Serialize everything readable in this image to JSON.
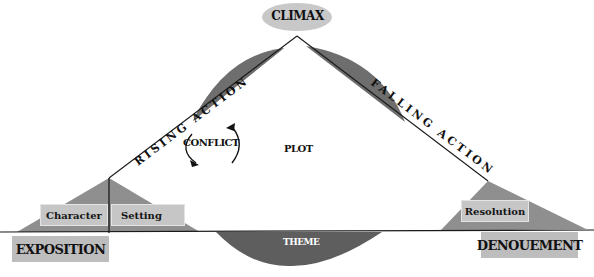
{
  "diagram": {
    "type": "plot-structure-diagram",
    "colors": {
      "background": "#ffffff",
      "climax_ellipse": "#c8c8c8",
      "dark_shade": "#6b6b6b",
      "light_shade": "#8e8e8e",
      "label_box": "#c6c6c6",
      "stage_box": "#bdbdbd",
      "line": "#1a1a1a",
      "theme_text": "#ffffff"
    },
    "climax": {
      "label": "CLIMAX"
    },
    "rising_action": {
      "label": "RISING ACTION"
    },
    "falling_action": {
      "label": "FALLING ACTION"
    },
    "center": {
      "conflict_label": "CONFLICT",
      "plot_label": "PLOT"
    },
    "theme": {
      "label": "THEME"
    },
    "exposition": {
      "label": "EXPOSITION",
      "elements": [
        {
          "label": "Character"
        },
        {
          "label": "Setting"
        }
      ]
    },
    "denouement": {
      "label": "DENOUEMENT",
      "elements": [
        {
          "label": "Resolution"
        }
      ]
    }
  }
}
